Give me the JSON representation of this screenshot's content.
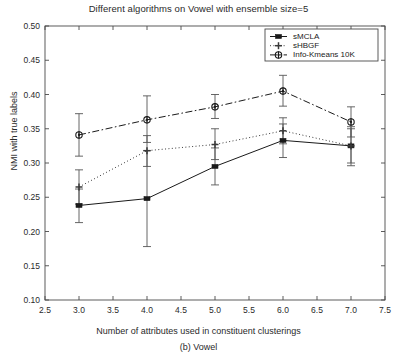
{
  "chart_data": {
    "type": "line",
    "title": "Different algorithms on Vowel with ensemble size=5",
    "caption": "(b) Vowel",
    "xlabel": "Number of attributes used in constituent clusterings",
    "ylabel": "NMI with true labels",
    "x": [
      3.0,
      4.0,
      5.0,
      6.0,
      7.0
    ],
    "xlim": [
      2.5,
      7.5
    ],
    "ylim": [
      0.1,
      0.5
    ],
    "xticks": [
      "2.5",
      "3.0",
      "3.5",
      "4.0",
      "4.5",
      "5.0",
      "5.5",
      "6.0",
      "6.5",
      "7.0",
      "7.5"
    ],
    "xtick_values": [
      2.5,
      3.0,
      3.5,
      4.0,
      4.5,
      5.0,
      5.5,
      6.0,
      6.5,
      7.0,
      7.5
    ],
    "yticks": [
      "0.10",
      "0.15",
      "0.20",
      "0.25",
      "0.30",
      "0.35",
      "0.40",
      "0.45",
      "0.50"
    ],
    "ytick_values": [
      0.1,
      0.15,
      0.2,
      0.25,
      0.3,
      0.35,
      0.4,
      0.45,
      0.5
    ],
    "grid": false,
    "legend_position": "upper right",
    "errorbars": true,
    "series": [
      {
        "name": "sMCLA",
        "linestyle": "solid",
        "marker": "filled-square",
        "color": "#1a1a1a",
        "values": [
          0.238,
          0.248,
          0.295,
          0.333,
          0.325
        ],
        "err_low": [
          0.213,
          0.178,
          0.268,
          0.308,
          0.296
        ],
        "err_high": [
          0.262,
          0.318,
          0.322,
          0.357,
          0.353
        ]
      },
      {
        "name": "sHBGF",
        "linestyle": "dotted",
        "marker": "plus",
        "color": "#3a3a3a",
        "values": [
          0.265,
          0.318,
          0.327,
          0.347,
          0.325
        ],
        "err_low": [
          0.24,
          0.295,
          0.305,
          0.328,
          0.3
        ],
        "err_high": [
          0.29,
          0.34,
          0.35,
          0.366,
          0.35
        ]
      },
      {
        "name": "Info-Kmeans 10K",
        "linestyle": "dashdot",
        "marker": "circle-dot",
        "color": "#1a1a1a",
        "values": [
          0.341,
          0.363,
          0.382,
          0.405,
          0.36
        ],
        "err_low": [
          0.31,
          0.33,
          0.365,
          0.383,
          0.338
        ],
        "err_high": [
          0.372,
          0.398,
          0.4,
          0.428,
          0.382
        ]
      }
    ],
    "legend": [
      "sMCLA",
      "sHBGF",
      "Info-Kmeans 10K"
    ]
  }
}
